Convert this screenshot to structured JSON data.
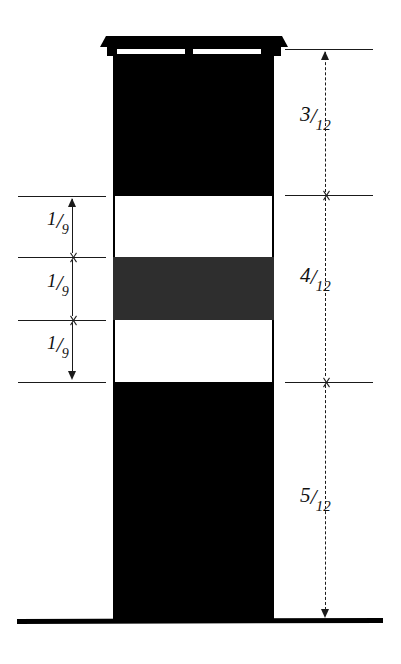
{
  "diagram": {
    "colors": {
      "solid": "#000000",
      "shaded": "#2e2e2e",
      "void": "#ffffff",
      "line": "#1a1a1a",
      "background": "#ffffff"
    },
    "column": {
      "segments": [
        {
          "name": "top-shaft",
          "fill": "black"
        },
        {
          "name": "upper-void-band",
          "fill": "white"
        },
        {
          "name": "shaded-band",
          "fill": "gray"
        },
        {
          "name": "lower-void-band",
          "fill": "white"
        },
        {
          "name": "bottom-shaft",
          "fill": "black"
        }
      ]
    },
    "right_dimensions": {
      "style": "dashed",
      "labels": [
        {
          "numerator": "3",
          "slash": "/",
          "denominator": "12"
        },
        {
          "numerator": "4",
          "slash": "/",
          "denominator": "12"
        },
        {
          "numerator": "5",
          "slash": "/",
          "denominator": "12"
        }
      ]
    },
    "left_dimensions": {
      "style": "solid",
      "labels": [
        {
          "numerator": "1",
          "slash": "/",
          "denominator": "9"
        },
        {
          "numerator": "1",
          "slash": "/",
          "denominator": "9"
        },
        {
          "numerator": "1",
          "slash": "/",
          "denominator": "9"
        }
      ]
    }
  }
}
